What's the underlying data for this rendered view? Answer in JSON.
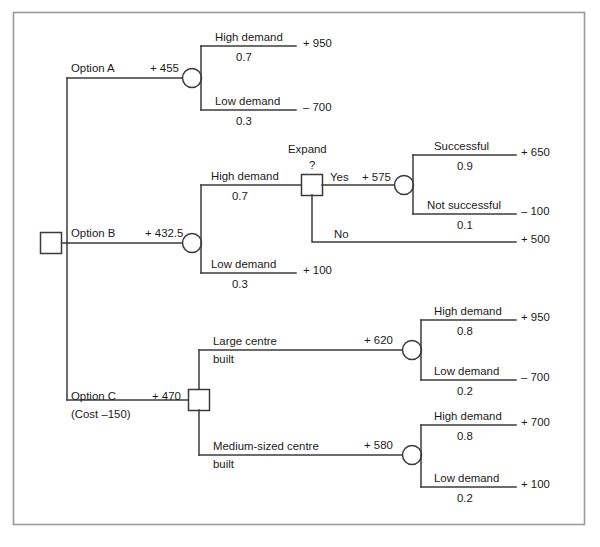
{
  "figure": {
    "frame": {
      "x": 13,
      "y": 12,
      "width": 572,
      "height": 513,
      "border_color": "#9a9a9a"
    },
    "line_color": "#3b3b3b",
    "text_color": "#1a1a1a"
  },
  "nodes": {
    "root": {
      "name": "root-decision-node",
      "type": "decision"
    },
    "a_chance": {
      "name": "option-a-chance-node",
      "type": "chance"
    },
    "b_chance": {
      "name": "option-b-chance-node",
      "type": "chance"
    },
    "expand_decision": {
      "name": "expand-decision-node",
      "type": "decision"
    },
    "expand_chance": {
      "name": "expand-chance-node",
      "type": "chance"
    },
    "c_decision": {
      "name": "option-c-decision-node",
      "type": "decision"
    },
    "large_chance": {
      "name": "large-centre-chance-node",
      "type": "chance"
    },
    "medium_chance": {
      "name": "medium-centre-chance-node",
      "type": "chance"
    }
  },
  "labels": {
    "option_a": "Option A",
    "option_a_ev": "+ 455",
    "option_a_high_demand": "High demand",
    "option_a_high_prob": "0.7",
    "option_a_high_payoff": "+ 950",
    "option_a_low_demand": "Low demand",
    "option_a_low_prob": "0.3",
    "option_a_low_payoff": "– 700",
    "option_b": "Option B",
    "option_b_ev": "+ 432.5",
    "option_b_high_demand": "High demand",
    "option_b_high_prob": "0.7",
    "option_b_low_demand": "Low demand",
    "option_b_low_prob": "0.3",
    "option_b_low_payoff": "+ 100",
    "expand_title_line1": "Expand",
    "expand_title_line2": "?",
    "expand_yes": "Yes",
    "expand_yes_ev": "+ 575",
    "expand_no": "No",
    "expand_no_payoff": "+ 500",
    "expand_successful": "Successful",
    "expand_successful_prob": "0.9",
    "expand_successful_payoff": "+ 650",
    "expand_not_successful": "Not successful",
    "expand_not_successful_prob": "0.1",
    "expand_not_successful_payoff": "– 100",
    "option_c": "Option C",
    "option_c_cost": "(Cost –150)",
    "option_c_ev": "+ 470",
    "large_centre_line1": "Large centre",
    "large_centre_line2": "built",
    "large_centre_ev": "+ 620",
    "large_high_demand": "High demand",
    "large_high_prob": "0.8",
    "large_high_payoff": "+ 950",
    "large_low_demand": "Low demand",
    "large_low_prob": "0.2",
    "large_low_payoff": "– 700",
    "medium_centre_line1": "Medium-sized centre",
    "medium_centre_line2": "built",
    "medium_centre_ev": "+ 580",
    "medium_high_demand": "High demand",
    "medium_high_prob": "0.8",
    "medium_high_payoff": "+ 700",
    "medium_low_demand": "Low demand",
    "medium_low_prob": "0.2",
    "medium_low_payoff": "+ 100"
  },
  "caption": ""
}
